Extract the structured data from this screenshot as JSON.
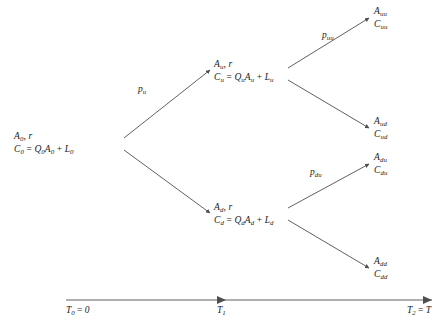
{
  "diagram": {
    "type": "binomial-tree",
    "nodes": {
      "root": {
        "line1": "A0, r",
        "line2": "C0 = Q0A0 + L0",
        "x": 105,
        "y": 143
      },
      "up": {
        "line1": "Au, r",
        "line2": "Cu = QuAu + Lu",
        "x": 212,
        "y": 70
      },
      "down": {
        "line1": "Ad, r",
        "line2": "Cd = QdAd + Ld",
        "x": 212,
        "y": 210
      },
      "leaf_uu": {
        "line1": "Auu",
        "line2": "Cuu",
        "x": 372,
        "y": 12
      },
      "leaf_ud": {
        "line1": "Aud",
        "line2": "Cud",
        "x": 372,
        "y": 122
      },
      "leaf_du": {
        "line1": "Adu",
        "line2": "Cdu",
        "x": 372,
        "y": 158
      },
      "leaf_dd": {
        "line1": "Add",
        "line2": "Cdd",
        "x": 372,
        "y": 262
      }
    },
    "edge_labels": {
      "p_u": "pu",
      "p_uu": "puu",
      "p_du": "pdu"
    },
    "axis": {
      "t0": "T0 = 0",
      "t1": "T1",
      "t2": "T2 = T"
    },
    "colors": {
      "line": "#4f4f4f",
      "text": "#1a1a1a",
      "background": "#ffffff"
    }
  }
}
